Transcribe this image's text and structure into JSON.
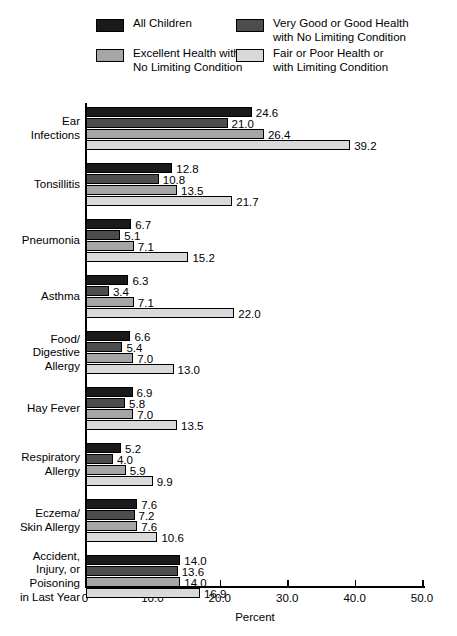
{
  "legend": {
    "items": [
      {
        "label": "All Children",
        "color": "#1a1a1a",
        "swatch_name": "legend-swatch-all-children"
      },
      {
        "label": "Very Good or Good Health\nwith No Limiting Condition",
        "color": "#4d4d4d",
        "swatch_name": "legend-swatch-very-good-good-health"
      },
      {
        "label": "Excellent Health with\nNo Limiting Condition",
        "color": "#a6a6a6",
        "swatch_name": "legend-swatch-excellent-health"
      },
      {
        "label": "Fair or Poor Health or\nwith Limiting Condition",
        "color": "#d9d9d9",
        "swatch_name": "legend-swatch-fair-poor-health"
      }
    ]
  },
  "chart_data": {
    "type": "bar",
    "orientation": "horizontal",
    "title": "",
    "xlabel": "Percent",
    "ylabel": "",
    "xlim": [
      0,
      50
    ],
    "xticks": [
      0,
      10,
      20,
      30,
      40,
      50
    ],
    "xtick_labels": [
      "0",
      "10.0",
      "20.0",
      "30.0",
      "40.0",
      "50.0"
    ],
    "grid": false,
    "legend_position": "top",
    "categories": [
      "Ear\nInfections",
      "Tonsillitis",
      "Pneumonia",
      "Asthma",
      "Food/\nDigestive\nAllergy",
      "Hay Fever",
      "Respiratory\nAllergy",
      "Eczema/\nSkin Allergy",
      "Accident,\nInjury, or\nPoisoning\nin Last Year"
    ],
    "series": [
      {
        "name": "All Children",
        "color": "#1a1a1a",
        "values": [
          24.6,
          12.8,
          6.7,
          6.3,
          6.6,
          6.9,
          5.2,
          7.6,
          14.0
        ],
        "labels": [
          "24.6",
          "12.8",
          "6.7",
          "6.3",
          "6.6",
          "6.9",
          "5.2",
          "7.6",
          "14.0"
        ]
      },
      {
        "name": "Very Good or Good Health with No Limiting Condition",
        "color": "#4d4d4d",
        "values": [
          21.0,
          10.8,
          5.1,
          3.4,
          5.4,
          5.8,
          4.0,
          7.2,
          13.6
        ],
        "labels": [
          "21.0",
          "10.8",
          "5.1",
          "3.4",
          "5.4",
          "5.8",
          "4.0",
          "7.2",
          "13.6"
        ]
      },
      {
        "name": "Excellent Health with No Limiting Condition",
        "color": "#a6a6a6",
        "values": [
          26.4,
          13.5,
          7.1,
          7.1,
          7.0,
          7.0,
          5.9,
          7.6,
          14.0
        ],
        "labels": [
          "26.4",
          "13.5",
          "7.1",
          "7.1",
          "7.0",
          "7.0",
          "5.9",
          "7.6",
          "14.0"
        ]
      },
      {
        "name": "Fair or Poor Health or with Limiting Condition",
        "color": "#d9d9d9",
        "values": [
          39.2,
          21.7,
          15.2,
          22.0,
          13.0,
          13.5,
          9.9,
          10.6,
          16.9
        ],
        "labels": [
          "39.2",
          "21.7",
          "15.2",
          "22.0",
          "13.0",
          "13.5",
          "9.9",
          "10.6",
          "16.9"
        ]
      }
    ]
  }
}
